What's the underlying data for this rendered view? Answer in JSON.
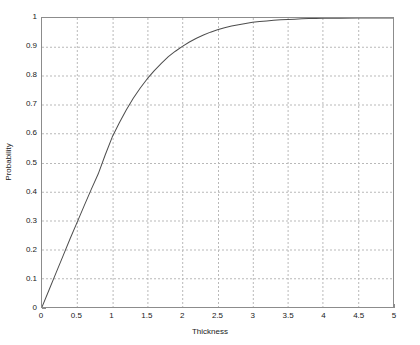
{
  "figure": {
    "background_color": "#ffffff",
    "axis_color": "#8c8c8c",
    "grid_color": "#b9b9b9",
    "curve_color": "#4d4d4d",
    "text_color": "#1a1a1a"
  },
  "chart_data": {
    "type": "line",
    "title": "",
    "subtitle": "",
    "xlabel": "Thickness",
    "ylabel": "Probability",
    "xlim": [
      0,
      5
    ],
    "ylim": [
      0,
      1
    ],
    "grid": true,
    "grid_style": "dashed",
    "legend": null,
    "legend_position": "none",
    "xticks": [
      0,
      0.5,
      1,
      1.5,
      2,
      2.5,
      3,
      3.5,
      4,
      4.5,
      5
    ],
    "xtick_labels": [
      "0",
      "0.5",
      "1",
      "1.5",
      "2",
      "2.5",
      "3",
      "3.5",
      "4",
      "4.5",
      "5"
    ],
    "yticks": [
      0,
      0.1,
      0.2,
      0.3,
      0.4,
      0.5,
      0.6,
      0.7,
      0.8,
      0.9,
      1
    ],
    "ytick_labels": [
      "0",
      "0.1",
      "0.2",
      "0.3",
      "0.4",
      "0.5",
      "0.6",
      "0.7",
      "0.8",
      "0.9",
      "1"
    ],
    "series": [
      {
        "name": "Probability",
        "color": "#4d4d4d",
        "line_width": 1,
        "x": [
          0,
          0.1,
          0.2,
          0.3,
          0.4,
          0.5,
          0.6,
          0.7,
          0.8,
          0.9,
          1,
          1.1,
          1.2,
          1.3,
          1.4,
          1.5,
          1.6,
          1.7,
          1.8,
          1.9,
          2,
          2.1,
          2.2,
          2.3,
          2.4,
          2.5,
          2.6,
          2.7,
          2.8,
          2.9,
          3,
          3.1,
          3.2,
          3.3,
          3.4,
          3.5,
          3.6,
          3.7,
          3.8,
          3.9,
          4,
          4.25,
          4.5,
          4.75,
          5
        ],
        "y": [
          0,
          0.059,
          0.118,
          0.177,
          0.236,
          0.293,
          0.35,
          0.406,
          0.46,
          0.526,
          0.588,
          0.637,
          0.682,
          0.722,
          0.758,
          0.79,
          0.818,
          0.843,
          0.866,
          0.885,
          0.902,
          0.917,
          0.93,
          0.941,
          0.951,
          0.959,
          0.966,
          0.972,
          0.977,
          0.981,
          0.985,
          0.988,
          0.99,
          0.992,
          0.994,
          0.995,
          0.996,
          0.997,
          0.998,
          0.998,
          0.999,
          0.999,
          1,
          1,
          1
        ]
      }
    ],
    "annotations": []
  }
}
